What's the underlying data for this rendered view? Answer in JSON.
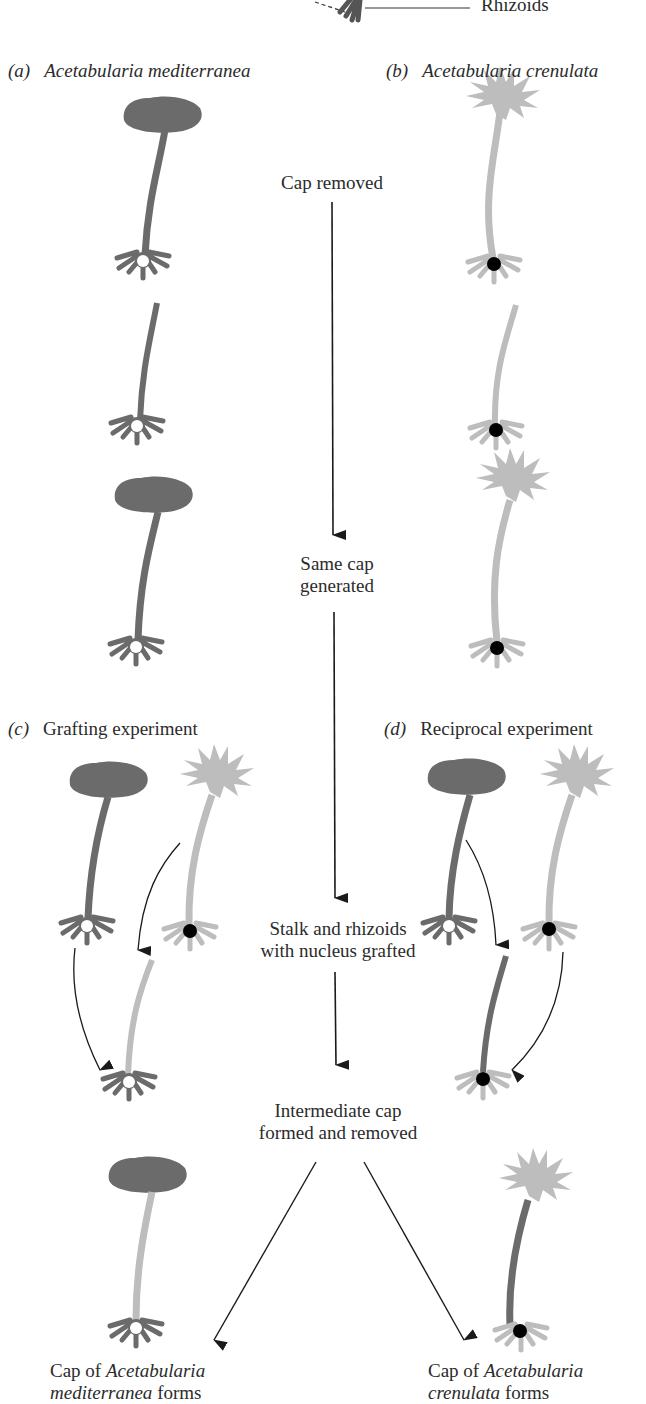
{
  "figure": {
    "top_label": {
      "rhizoids": "Rhizoids"
    },
    "panels": {
      "a": {
        "letter": "(a)",
        "title": "Acetabularia mediterranea"
      },
      "b": {
        "letter": "(b)",
        "title": "Acetabularia crenulata"
      },
      "c": {
        "letter": "(c)",
        "title": "Grafting experiment"
      },
      "d": {
        "letter": "(d)",
        "title": "Reciprocal experiment"
      }
    },
    "steps": {
      "cap_removed": "Cap removed",
      "same_cap_line1": "Same cap",
      "same_cap_line2": "generated",
      "grafted_line1": "Stalk and rhizoids",
      "grafted_line2": "with nucleus grafted",
      "intermediate_line1": "Intermediate cap",
      "intermediate_line2": "formed and removed"
    },
    "results": {
      "left": {
        "prefix": "Cap of ",
        "species_line1": "Acetabularia",
        "species_line2": "mediterranea",
        "suffix": " forms"
      },
      "right": {
        "prefix": "Cap of ",
        "species_line1": "Acetabularia",
        "species_line2": "crenulata",
        "suffix": " forms"
      }
    },
    "colors": {
      "mediterranea": "#6b6b6b",
      "crenulata": "#bdbdbd",
      "nucleus_med": "#ffffff",
      "nucleus_cren": "#000000",
      "arrow": "#1a1a1a"
    }
  }
}
